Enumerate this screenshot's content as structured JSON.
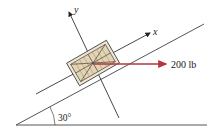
{
  "diagram": {
    "type": "free-body / inclined plane",
    "axes": {
      "x_label": "x",
      "y_label": "y"
    },
    "force": {
      "label": "200 lb",
      "direction": "horizontal",
      "color": "#b5373a"
    },
    "incline": {
      "angle_label": "30°",
      "angle_deg": 30
    },
    "crate": {
      "fill": "#e8dcc4",
      "stroke": "#3a3a3a",
      "hatch": "#b7a37e"
    },
    "colors": {
      "line": "#3a3a3a",
      "background": "#ffffff"
    }
  }
}
